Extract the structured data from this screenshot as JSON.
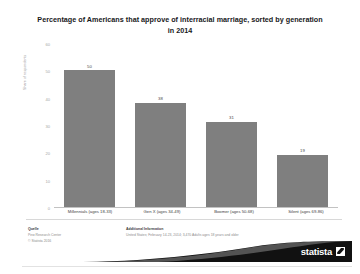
{
  "chart_data": {
    "type": "bar",
    "title": "Percentage of Americans that approve of interracial marriage, sorted by generation in 2014",
    "xlabel": "",
    "ylabel": "Share of respondents",
    "categories": [
      "Millennials (ages 18-33)",
      "Gen X (ages 34-49)",
      "Boomer (ages 50-68)",
      "Silent (ages 69-86)"
    ],
    "values": [
      50,
      38,
      31,
      19
    ],
    "ylim": [
      0,
      60
    ],
    "yticks": [
      0,
      10,
      20,
      30,
      40,
      50,
      60
    ],
    "grid": false,
    "legend": false,
    "bar_color": "#7f7f7f"
  },
  "footer": {
    "source_heading": "Quelle",
    "source_lines": "Pew Research Center\n© Statista 2016",
    "info_heading": "Additional Information",
    "info_lines": "United States; February 14-23, 2014; 3,470 Adults ages 18 years and older"
  },
  "brand": {
    "name": "statista"
  }
}
